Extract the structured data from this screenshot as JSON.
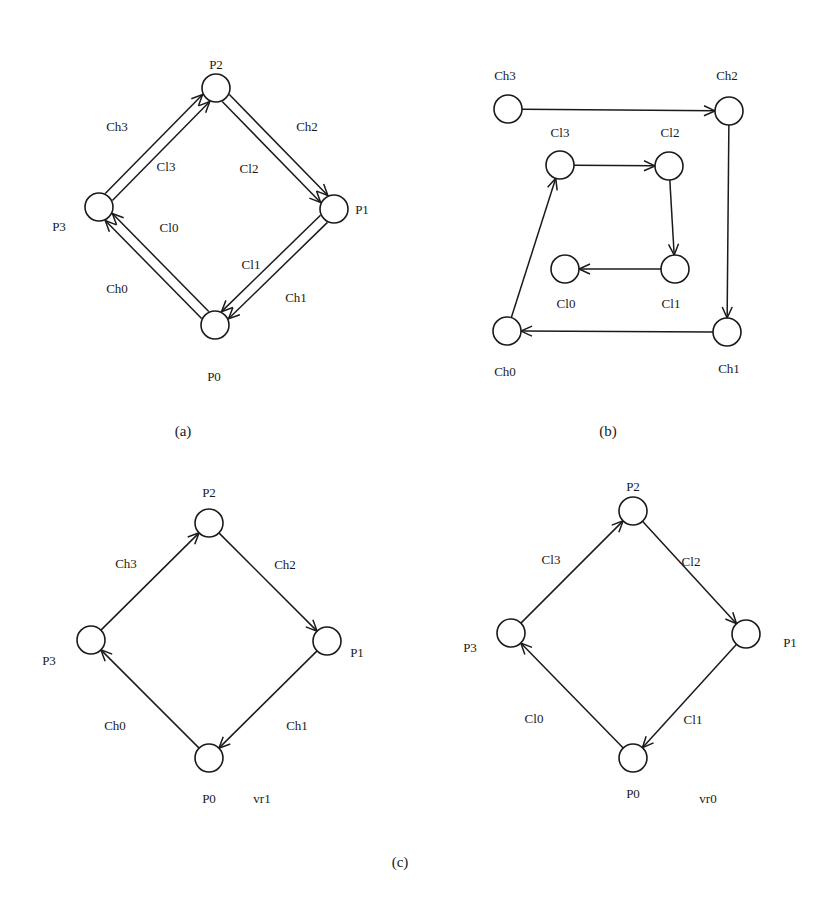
{
  "style": {
    "stroke_color": "#1a1a1a",
    "background": "#ffffff",
    "node_radius": 14
  },
  "diagrams": [
    {
      "id": "a",
      "caption": "(a)",
      "caption_pos": [
        183,
        433
      ],
      "nodes": [
        {
          "id": "P2",
          "x": 216,
          "y": 88
        },
        {
          "id": "P1",
          "x": 334,
          "y": 209
        },
        {
          "id": "P0",
          "x": 215,
          "y": 325
        },
        {
          "id": "P3",
          "x": 99,
          "y": 207
        }
      ],
      "edges": [
        {
          "from": "P3",
          "to": "P2",
          "offset": -5,
          "label": "Ch3"
        },
        {
          "from": "P3",
          "to": "P2",
          "offset": 5,
          "label": "Cl3"
        },
        {
          "from": "P2",
          "to": "P1",
          "offset": -5,
          "label": "Ch2"
        },
        {
          "from": "P2",
          "to": "P1",
          "offset": 5,
          "label": "Cl2"
        },
        {
          "from": "P1",
          "to": "P0",
          "offset": 5,
          "label": "Cl1"
        },
        {
          "from": "P1",
          "to": "P0",
          "offset": -5,
          "label": "Ch1"
        },
        {
          "from": "P0",
          "to": "P3",
          "offset": 5,
          "label": "Ch0"
        },
        {
          "from": "P0",
          "to": "P3",
          "offset": -5,
          "label": "Cl0"
        }
      ],
      "labels": [
        {
          "text": "P2",
          "x": 216,
          "y": 66
        },
        {
          "text": "P1",
          "x": 362,
          "y": 211
        },
        {
          "text": "P0",
          "x": 214,
          "y": 378
        },
        {
          "text": "P3",
          "x": 59,
          "y": 228
        },
        {
          "text": "Ch3",
          "x": 117,
          "y": 128
        },
        {
          "text": "Cl3",
          "x": 166,
          "y": 168
        },
        {
          "text": "Cl2",
          "x": 249,
          "y": 170
        },
        {
          "text": "Ch2",
          "x": 307,
          "y": 128
        },
        {
          "text": "Cl0",
          "x": 169,
          "y": 229
        },
        {
          "text": "Cl1",
          "x": 251,
          "y": 266
        },
        {
          "text": "Ch0",
          "x": 117,
          "y": 290
        },
        {
          "text": "Ch1",
          "x": 296,
          "y": 299
        }
      ]
    },
    {
      "id": "b",
      "caption": "(b)",
      "caption_pos": [
        608,
        433
      ],
      "nodes": [
        {
          "id": "Ch3",
          "x": 508,
          "y": 109
        },
        {
          "id": "Ch2",
          "x": 729,
          "y": 111
        },
        {
          "id": "Cl3",
          "x": 560,
          "y": 165
        },
        {
          "id": "Cl2",
          "x": 669,
          "y": 166
        },
        {
          "id": "Cl0",
          "x": 565,
          "y": 269
        },
        {
          "id": "Cl1",
          "x": 675,
          "y": 269
        },
        {
          "id": "Ch0",
          "x": 507,
          "y": 331
        },
        {
          "id": "Ch1",
          "x": 727,
          "y": 332
        }
      ],
      "edges": [
        {
          "from": "Ch3",
          "to": "Ch2",
          "offset": 0
        },
        {
          "from": "Ch2",
          "to": "Ch1",
          "offset": 0
        },
        {
          "from": "Ch1",
          "to": "Ch0",
          "offset": 0
        },
        {
          "from": "Ch0",
          "to": "Cl3",
          "offset": 0
        },
        {
          "from": "Cl3",
          "to": "Cl2",
          "offset": 0
        },
        {
          "from": "Cl2",
          "to": "Cl1",
          "offset": 0
        },
        {
          "from": "Cl1",
          "to": "Cl0",
          "offset": 0
        }
      ],
      "labels": [
        {
          "text": "Ch3",
          "x": 505,
          "y": 77
        },
        {
          "text": "Ch2",
          "x": 727,
          "y": 77
        },
        {
          "text": "Cl3",
          "x": 560,
          "y": 134
        },
        {
          "text": "Cl2",
          "x": 670,
          "y": 134
        },
        {
          "text": "Cl0",
          "x": 566,
          "y": 305
        },
        {
          "text": "Cl1",
          "x": 671,
          "y": 305
        },
        {
          "text": "Ch0",
          "x": 505,
          "y": 373
        },
        {
          "text": "Ch1",
          "x": 729,
          "y": 370
        }
      ]
    },
    {
      "id": "c-left",
      "nodes": [
        {
          "id": "P2",
          "x": 209,
          "y": 523
        },
        {
          "id": "P1",
          "x": 327,
          "y": 641
        },
        {
          "id": "P0",
          "x": 209,
          "y": 758
        },
        {
          "id": "P3",
          "x": 91,
          "y": 640
        }
      ],
      "edges": [
        {
          "from": "P3",
          "to": "P2",
          "offset": 0,
          "label": "Ch3"
        },
        {
          "from": "P2",
          "to": "P1",
          "offset": 0,
          "label": "Ch2"
        },
        {
          "from": "P1",
          "to": "P0",
          "offset": 0,
          "label": "Ch1"
        },
        {
          "from": "P0",
          "to": "P3",
          "offset": 0,
          "label": "Ch0"
        }
      ],
      "labels": [
        {
          "text": "P2",
          "x": 209,
          "y": 494
        },
        {
          "text": "Ch3",
          "x": 126,
          "y": 565
        },
        {
          "text": "Ch2",
          "x": 285,
          "y": 566
        },
        {
          "text": "P3",
          "x": 49,
          "y": 662
        },
        {
          "text": "P1",
          "x": 357,
          "y": 654
        },
        {
          "text": "Ch0",
          "x": 115,
          "y": 727
        },
        {
          "text": "Ch1",
          "x": 297,
          "y": 727
        },
        {
          "text": "P0",
          "x": 209,
          "y": 800
        },
        {
          "text": "vr1",
          "x": 262,
          "y": 800
        }
      ]
    },
    {
      "id": "c-right",
      "nodes": [
        {
          "id": "P2",
          "x": 633,
          "y": 511
        },
        {
          "id": "P1",
          "x": 746,
          "y": 634
        },
        {
          "id": "P0",
          "x": 633,
          "y": 758
        },
        {
          "id": "P3",
          "x": 511,
          "y": 633
        }
      ],
      "edges": [
        {
          "from": "P3",
          "to": "P2",
          "offset": 0,
          "label": "Cl3"
        },
        {
          "from": "P2",
          "to": "P1",
          "offset": 0,
          "label": "Cl2"
        },
        {
          "from": "P1",
          "to": "P0",
          "offset": 0,
          "label": "Cl1"
        },
        {
          "from": "P0",
          "to": "P3",
          "offset": 0,
          "label": "Cl0"
        }
      ],
      "labels": [
        {
          "text": "P2",
          "x": 633,
          "y": 488
        },
        {
          "text": "Cl3",
          "x": 551,
          "y": 561
        },
        {
          "text": "Cl2",
          "x": 691,
          "y": 563
        },
        {
          "text": "P3",
          "x": 470,
          "y": 649
        },
        {
          "text": "P1",
          "x": 790,
          "y": 644
        },
        {
          "text": "Cl0",
          "x": 534,
          "y": 720
        },
        {
          "text": "Cl1",
          "x": 693,
          "y": 721
        },
        {
          "text": "P0",
          "x": 633,
          "y": 795
        },
        {
          "text": "vr0",
          "x": 708,
          "y": 800
        }
      ]
    }
  ],
  "captions": {
    "a": "(a)",
    "b": "(b)",
    "c": "(c)"
  },
  "caption_c_pos": [
    400,
    864
  ]
}
